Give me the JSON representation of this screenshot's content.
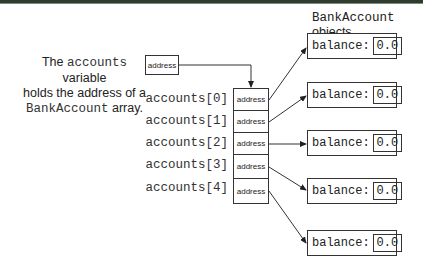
{
  "caption": {
    "line1_pre": "The ",
    "line1_code": "accounts",
    "line1_post": " variable",
    "line2": "holds the address of a",
    "line3_code": "BankAccount",
    "line3_post": " array."
  },
  "variable_box": {
    "value": "address"
  },
  "objects_header": {
    "code": "BankAccount",
    "text": " objects"
  },
  "array": {
    "elements": [
      {
        "label": "accounts[0]",
        "value": "address"
      },
      {
        "label": "accounts[1]",
        "value": "address"
      },
      {
        "label": "accounts[2]",
        "value": "address"
      },
      {
        "label": "accounts[3]",
        "value": "address"
      },
      {
        "label": "accounts[4]",
        "value": "address"
      }
    ]
  },
  "objects": [
    {
      "field": "balance:",
      "value": "0.0"
    },
    {
      "field": "balance:",
      "value": "0.0"
    },
    {
      "field": "balance:",
      "value": "0.0"
    },
    {
      "field": "balance:",
      "value": "0.0"
    },
    {
      "field": "balance:",
      "value": "0.0"
    }
  ],
  "colors": {
    "top_rule": "#2f3b2f",
    "stroke": "#333333"
  }
}
